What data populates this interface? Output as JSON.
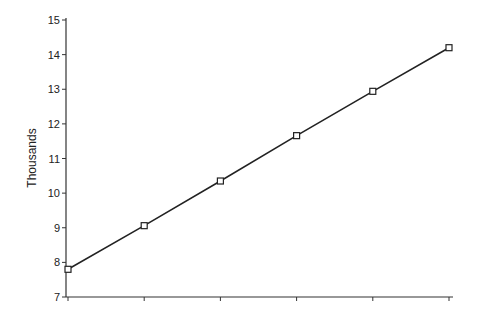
{
  "chart_data": {
    "type": "line",
    "title": "",
    "xlabel": "",
    "ylabel": "Thousands",
    "ylim": [
      7,
      15
    ],
    "yticks": [
      7,
      8,
      9,
      10,
      11,
      12,
      13,
      14,
      15
    ],
    "xtick_count": 6,
    "grid": false,
    "legend": null,
    "marker": "square",
    "series": [
      {
        "name": "Series 1",
        "x": [
          1,
          2,
          3,
          4,
          5,
          6
        ],
        "values": [
          7.8,
          9.06,
          10.35,
          11.66,
          12.94,
          14.2
        ]
      }
    ],
    "colors": {
      "line": "#222222",
      "axis": "#333333",
      "marker_fill": "#ffffff"
    }
  }
}
